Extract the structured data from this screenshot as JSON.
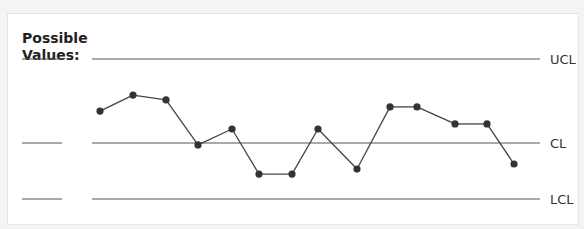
{
  "chart_data": {
    "type": "line",
    "title": "Possible Values:",
    "title_lines": [
      "Possible",
      "Values:"
    ],
    "control_lines": [
      {
        "name": "UCL",
        "label": "UCL",
        "value": 3
      },
      {
        "name": "CL",
        "label": "CL",
        "value": 0
      },
      {
        "name": "LCL",
        "label": "LCL",
        "value": -2
      }
    ],
    "x": [
      1,
      2,
      3,
      4,
      5,
      6,
      7,
      8,
      9,
      10,
      11,
      12,
      13,
      14
    ],
    "values": [
      1.14,
      1.71,
      1.54,
      -0.07,
      0.5,
      -1.11,
      -1.11,
      0.5,
      -0.93,
      1.29,
      1.29,
      0.68,
      0.68,
      -0.75
    ],
    "ylim": [
      -2,
      3
    ],
    "grid": false,
    "legend": "none",
    "colors": {
      "line": "#444444",
      "point": "#333333",
      "rule": "#555555"
    }
  }
}
